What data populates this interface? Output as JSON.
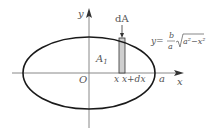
{
  "diagram": {
    "colors": {
      "ellipse": "#1a1a1a",
      "axis": "#888888",
      "strip_fill": "#cfcfcf",
      "strip_stroke": "#333333",
      "text": "#555555"
    },
    "labels": {
      "y_axis": "y",
      "x_axis": "x",
      "origin": "O",
      "a_label": "a",
      "area_label": "A",
      "area_subscript": "1",
      "strip_label": "dA",
      "x_left": "x",
      "x_right": "x+dx",
      "equation_lhs": "y=",
      "equation_frac_num": "b",
      "equation_frac_den": "a",
      "equation_radicand": "a²−x²"
    }
  }
}
